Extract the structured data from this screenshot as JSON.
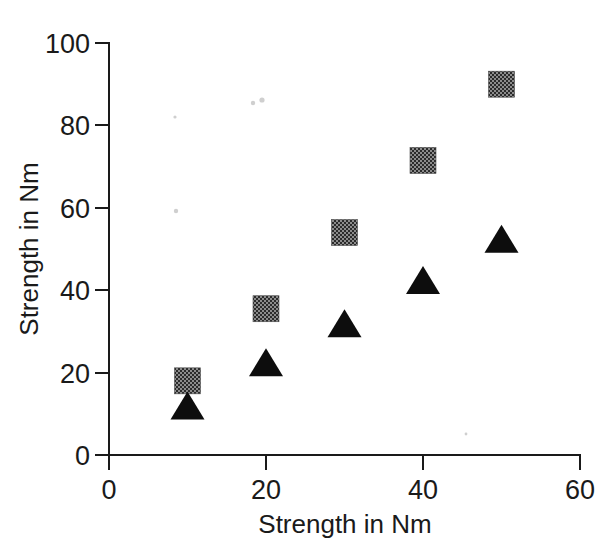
{
  "chart_data": {
    "type": "scatter",
    "title": "",
    "xlabel": "Strength in Nm",
    "ylabel": "Strength in Nm",
    "xlim": [
      0,
      60
    ],
    "ylim": [
      0,
      100
    ],
    "xticks": [
      0,
      20,
      40,
      60
    ],
    "yticks": [
      0,
      20,
      40,
      60,
      80,
      100
    ],
    "xtick_labels": [
      "0",
      "20",
      "40",
      "60"
    ],
    "ytick_labels": [
      "0",
      "20",
      "40",
      "60",
      "80",
      "100"
    ],
    "grid": false,
    "legend": "none",
    "x": [
      10,
      20,
      30,
      40,
      50
    ],
    "series": [
      {
        "name": "square-series",
        "marker": "square",
        "color": "#5a5a5a",
        "values": [
          18,
          35.5,
          54,
          71.5,
          90
        ]
      },
      {
        "name": "triangle-series",
        "marker": "triangle",
        "color": "#0d0d0d",
        "values": [
          12,
          22.5,
          32,
          42.5,
          52.5
        ]
      }
    ]
  },
  "axes": {
    "x_title": "Strength in Nm",
    "y_title": "Strength in Nm"
  },
  "ticks": {
    "y": [
      {
        "label": "100",
        "value": 100
      },
      {
        "label": "80",
        "value": 80
      },
      {
        "label": "60",
        "value": 60
      },
      {
        "label": "40",
        "value": 40
      },
      {
        "label": "20",
        "value": 20
      },
      {
        "label": "0",
        "value": 0
      }
    ],
    "x": [
      {
        "label": "0",
        "value": 0
      },
      {
        "label": "20",
        "value": 20
      },
      {
        "label": "40",
        "value": 40
      },
      {
        "label": "60",
        "value": 60
      }
    ]
  },
  "colors": {
    "axis": "#1a1a1a",
    "triangle_fill": "#0d0d0d",
    "square_fill": "#5a5a5a",
    "background": "#ffffff"
  }
}
